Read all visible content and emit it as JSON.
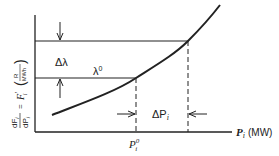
{
  "diagram": {
    "type": "incremental-cost-curve",
    "y_axis_label": {
      "numerator": "dF",
      "numerator_sub": "i",
      "denominator": "dP",
      "denominator_sub": "i",
      "equals": "=",
      "rhs": "F",
      "rhs_sub": "i",
      "rhs_prime": "′",
      "units_numerator": "R",
      "units_denominator": "MWh"
    },
    "x_axis_label": {
      "symbol": "P",
      "sub": "i",
      "units": "(MW)"
    },
    "annotations": {
      "delta_lambda": "Δλ",
      "lambda_zero": "λ",
      "lambda_zero_sup": "0",
      "delta_p": "ΔP",
      "delta_p_sub": "i",
      "p_zero": "P",
      "p_zero_sup": "0",
      "p_zero_sub": "i"
    },
    "colors": {
      "ink": "#222222",
      "background": "#ffffff"
    }
  }
}
